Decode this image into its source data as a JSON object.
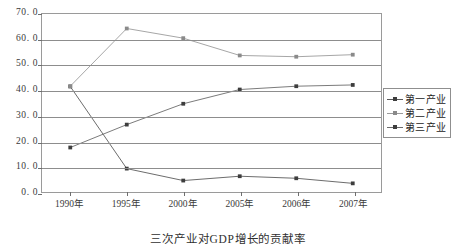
{
  "chart_data": {
    "type": "line",
    "title": "",
    "caption": "三次产业对GDP增长的贡献率",
    "xlabel": "",
    "ylabel": "",
    "categories": [
      "1990年",
      "1995年",
      "2000年",
      "2005年",
      "2006年",
      "2007年"
    ],
    "ylim": [
      0.0,
      70.0
    ],
    "ytick_labels": [
      "0. 0",
      "10. 0",
      "20. 0",
      "30. 0",
      "40. 0",
      "50. 0",
      "60. 0",
      "70. 0"
    ],
    "ytick_values": [
      0.0,
      10.0,
      20.0,
      30.0,
      40.0,
      50.0,
      60.0,
      70.0
    ],
    "grid": true,
    "legend_position": "right",
    "series": [
      {
        "name": "第一产业",
        "color": "#5a5a5a",
        "marker": "square",
        "values": [
          41.5,
          9.2,
          4.5,
          6.2,
          5.4,
          3.4
        ]
      },
      {
        "name": "第二产业",
        "color": "#9b9b9b",
        "marker": "square",
        "values": [
          41.6,
          64.3,
          60.5,
          53.7,
          53.2,
          54.0
        ]
      },
      {
        "name": "第三产业",
        "color": "#6b6b6b",
        "marker": "square",
        "values": [
          17.5,
          26.5,
          34.7,
          40.3,
          41.6,
          42.1
        ]
      }
    ]
  },
  "colors": {
    "axis": "#9a9a9a",
    "grid": "#8d8d8d",
    "text": "#2f2f2f",
    "background": "#ffffff"
  }
}
